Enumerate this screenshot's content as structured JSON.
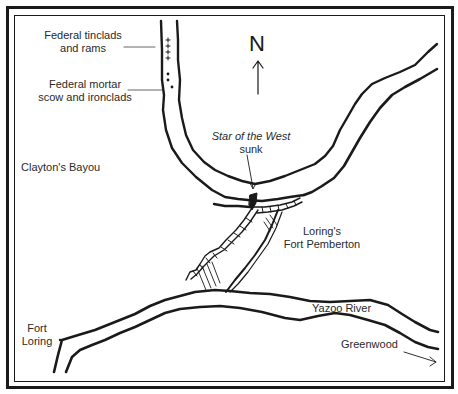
{
  "map": {
    "title": "Fort Pemberton area map",
    "compass": {
      "label": "N"
    },
    "labels": {
      "federal_tinclads": [
        "Federal tinclads",
        "and rams"
      ],
      "federal_mortar": [
        "Federal mortar",
        "scow and ironclads"
      ],
      "claytons_bayou": "Clayton's Bayou",
      "star_of_the_west": "Star of the West",
      "sunk": "sunk",
      "lorings": "Loring's",
      "fort_pemberton": "Fort Pemberton",
      "yazoo_river": "Yazoo River",
      "fort_loring": [
        "Fort",
        "Loring"
      ],
      "greenwood": "Greenwood"
    },
    "colors": {
      "ink": "#1a1a1a",
      "text": "#2a2a2a",
      "background": "#ffffff"
    }
  }
}
